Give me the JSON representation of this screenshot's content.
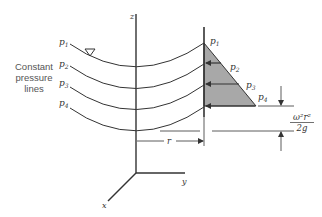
{
  "figure": {
    "side_label_lines": [
      "Constant",
      "pressure",
      "lines"
    ],
    "axis_labels": {
      "z": "z",
      "y": "y",
      "x": "x"
    },
    "pressure_labels_left": [
      "p1",
      "p2",
      "p3",
      "p4"
    ],
    "pressure_labels_wall": [
      "p1",
      "p2",
      "p3",
      "p4"
    ],
    "dimension_r": "r",
    "dimension_height_numerator": "ω²r²",
    "dimension_height_denominator": "2g",
    "free_surface_marker": "inverted-triangle",
    "colors": {
      "line": "#333333",
      "shade": "#a8a8a8",
      "text": "#333333"
    }
  }
}
